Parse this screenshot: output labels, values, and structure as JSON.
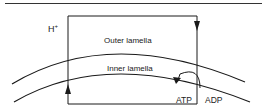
{
  "diagram": {
    "labels": {
      "proton": "H",
      "proton_charge": "+",
      "outer": "Outer lamella",
      "inner": "Inner lamella",
      "atp": "ATP",
      "adp": "ADP"
    },
    "colors": {
      "stroke": "#1a1a1a",
      "background": "#ffffff"
    }
  }
}
